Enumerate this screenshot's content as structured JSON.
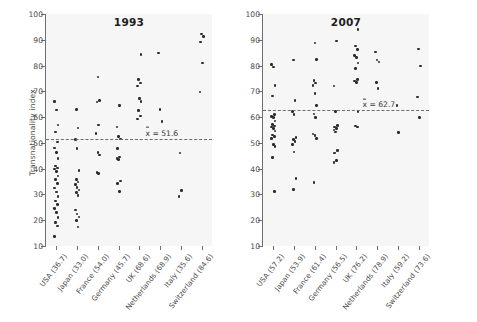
{
  "chart_data": {
    "type": "scatter",
    "title": "",
    "xlabel": "",
    "ylabel": "Transnationality index",
    "ylim": [
      10,
      100
    ],
    "yticks": [
      10,
      20,
      30,
      40,
      50,
      60,
      70,
      80,
      90,
      100
    ],
    "grid": false,
    "legend": "none",
    "panels": [
      {
        "title": "1993",
        "mean": 51.6,
        "mean_label": "= 51.6",
        "mean_symbol": "x",
        "categories": [
          "USA (36.7)",
          "Japan (33.0)",
          "France (54.0)",
          "Germany (45.7)",
          "UK (68.6)",
          "Netherlands (68.9)",
          "Italy (35.6)",
          "Switzerland (84.6)"
        ],
        "series": [
          {
            "name": "USA (36.7)",
            "values": [
              66.0,
              62.8,
              57.0,
              54.3,
              50.3,
              48.0,
              46.2,
              44.0,
              41.0,
              40.2,
              39.8,
              39.0,
              37.2,
              35.8,
              34.2,
              32.5,
              31.0,
              29.2,
              27.5,
              26.0,
              24.5,
              23.0,
              21.0,
              19.2,
              17.8,
              13.8
            ]
          },
          {
            "name": "Japan (33.0)",
            "values": [
              63.0,
              55.7,
              51.2,
              47.9,
              39.2,
              35.8,
              34.8,
              33.8,
              32.8,
              31.8,
              30.8,
              29.5,
              24.0,
              22.4,
              21.2,
              19.8,
              17.4
            ]
          },
          {
            "name": "France (54.0)",
            "values": [
              75.6,
              66.5,
              65.8,
              57.0,
              53.6,
              46.2,
              45.3,
              38.4,
              38.1
            ]
          },
          {
            "name": "Germany (45.7)",
            "values": [
              64.6,
              56.2,
              52.4,
              51.5,
              47.9,
              44.5,
              43.9,
              43.5,
              35.2,
              34.2,
              31.2
            ]
          },
          {
            "name": "UK (68.6)",
            "values": [
              84.4,
              74.5,
              73.2,
              72.0,
              67.2,
              66.0,
              62.5,
              60.5,
              59.2
            ]
          },
          {
            "name": "Netherlands (68.9)",
            "values": [
              84.9,
              63.0,
              58.4
            ]
          },
          {
            "name": "Italy (35.6)",
            "values": [
              46.1,
              31.6,
              29.2
            ]
          },
          {
            "name": "Switzerland (84.6)",
            "values": [
              92.3,
              91.2,
              89.2,
              81.0,
              69.8
            ]
          }
        ]
      },
      {
        "title": "2007",
        "mean": 62.7,
        "mean_label": "= 62.7",
        "mean_symbol": "x",
        "categories": [
          "USA (57.2)",
          "Japan (53.9)",
          "France (61.4)",
          "Germany (56.5)",
          "UK (76.2)",
          "Netherlands (78.9)",
          "Italy (59.2)",
          "Switzerland (73.6)"
        ],
        "series": [
          {
            "name": "USA (57.2)",
            "values": [
              80.3,
              79.4,
              72.2,
              68.2,
              61.0,
              60.2,
              59.8,
              58.5,
              57.2,
              56.6,
              56.2,
              55.6,
              54.6,
              53.0,
              52.4,
              51.8,
              49.4,
              48.6,
              44.4,
              31.2
            ]
          },
          {
            "name": "Japan (53.9)",
            "values": [
              82.2,
              66.5,
              62.2,
              61.0,
              52.0,
              51.2,
              50.6,
              49.4,
              46.5,
              36.2,
              32.0
            ]
          },
          {
            "name": "France (61.4)",
            "values": [
              88.8,
              82.4,
              74.2,
              73.2,
              72.2,
              69.2,
              64.4,
              61.2,
              59.8,
              53.4,
              52.8,
              51.8,
              34.6
            ]
          },
          {
            "name": "Germany (56.5)",
            "values": [
              89.5,
              72.0,
              62.2,
              56.8,
              56.2,
              55.6,
              55.0,
              54.2,
              47.0,
              46.0,
              43.2,
              42.4
            ]
          },
          {
            "name": "UK (76.2)",
            "values": [
              94.0,
              87.6,
              86.2,
              84.0,
              83.2,
              81.0,
              78.8,
              74.6,
              74.0,
              73.4,
              62.2,
              56.6,
              56.2
            ]
          },
          {
            "name": "Netherlands (78.9)",
            "values": [
              85.2,
              82.2,
              81.4,
              73.4,
              71.2
            ]
          },
          {
            "name": "Italy (59.2)",
            "values": [
              64.6,
              54.0
            ]
          },
          {
            "name": "Switzerland (73.6)",
            "values": [
              86.5,
              79.8,
              67.8,
              59.8
            ]
          }
        ]
      }
    ]
  }
}
